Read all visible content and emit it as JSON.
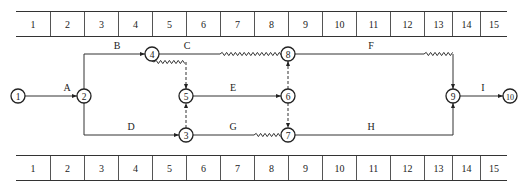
{
  "time_scale": {
    "units": [
      "1",
      "2",
      "3",
      "4",
      "5",
      "6",
      "7",
      "8",
      "9",
      "10",
      "11",
      "12",
      "13",
      "14",
      "15"
    ],
    "widths": [
      34,
      34,
      34,
      34,
      34,
      34,
      34,
      34,
      34,
      34,
      34,
      34,
      28,
      28,
      27
    ]
  },
  "nodes": [
    {
      "id": "1",
      "x": 18,
      "y": 96
    },
    {
      "id": "2",
      "x": 84,
      "y": 96
    },
    {
      "id": "3",
      "x": 186,
      "y": 135
    },
    {
      "id": "4",
      "x": 152,
      "y": 54
    },
    {
      "id": "5",
      "x": 186,
      "y": 96
    },
    {
      "id": "6",
      "x": 288,
      "y": 96
    },
    {
      "id": "7",
      "x": 288,
      "y": 135
    },
    {
      "id": "8",
      "x": 288,
      "y": 54
    },
    {
      "id": "9",
      "x": 453,
      "y": 96
    },
    {
      "id": "10",
      "x": 510,
      "y": 96
    }
  ],
  "activities": [
    {
      "label": "A",
      "from": "1",
      "to": "2",
      "label_x": 67,
      "label_y": 91
    },
    {
      "label": "B",
      "from": "2",
      "to": "4",
      "label_x": 117,
      "label_y": 49
    },
    {
      "label": "C",
      "from": "4",
      "to": "8",
      "label_x": 187,
      "label_y": 49
    },
    {
      "label": "D",
      "from": "2",
      "to": "3",
      "label_x": 131,
      "label_y": 130
    },
    {
      "label": "E",
      "from": "5",
      "to": "6",
      "label_x": 233,
      "label_y": 91
    },
    {
      "label": "F",
      "from": "8",
      "to": "9",
      "label_x": 371,
      "label_y": 49
    },
    {
      "label": "G",
      "from": "3",
      "to": "7",
      "label_x": 233,
      "label_y": 130
    },
    {
      "label": "H",
      "from": "7",
      "to": "9",
      "label_x": 371,
      "label_y": 130
    },
    {
      "label": "I",
      "from": "9",
      "to": "10",
      "label_x": 483,
      "label_y": 91
    }
  ],
  "dummy_activities": [
    {
      "from": "4",
      "to": "5"
    },
    {
      "from": "3",
      "to": "5"
    },
    {
      "from": "6",
      "to": "8"
    },
    {
      "from": "6",
      "to": "7"
    }
  ],
  "free_float_segments": [
    {
      "after": "C",
      "x1": 220,
      "x2": 282,
      "y": 54
    },
    {
      "after": "4-5",
      "x1": 154,
      "x2": 186,
      "y": 62
    },
    {
      "after": "G",
      "x1": 254,
      "x2": 282,
      "y": 135
    },
    {
      "after": "F",
      "x1": 424,
      "x2": 453,
      "y": 54
    }
  ]
}
